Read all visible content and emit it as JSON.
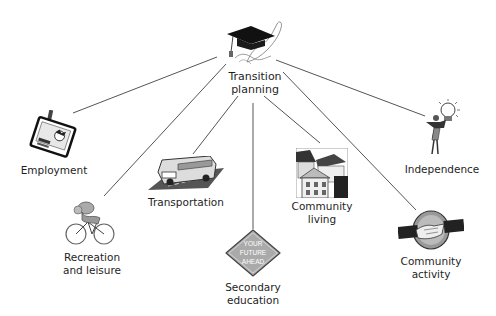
{
  "diagram": {
    "type": "hub-and-spoke",
    "center": {
      "id": "transition-planning",
      "label_line1": "Transition",
      "label_line2": "planning",
      "icon": "graduation-cap-diploma-icon"
    },
    "nodes": [
      {
        "id": "employment",
        "label_line1": "Employment",
        "label_line2": "",
        "icon": "id-badge-icon"
      },
      {
        "id": "recreation",
        "label_line1": "Recreation",
        "label_line2": "and leisure",
        "icon": "cyclist-icon"
      },
      {
        "id": "transportation",
        "label_line1": "Transportation",
        "label_line2": "",
        "icon": "bus-icon"
      },
      {
        "id": "secondary-education",
        "label_line1": "Secondary",
        "label_line2": "education",
        "icon": "road-sign-icon",
        "sign_text": [
          "YOUR",
          "FUTURE",
          "AHEAD"
        ]
      },
      {
        "id": "community-living",
        "label_line1": "Community",
        "label_line2": "living",
        "icon": "houses-icon"
      },
      {
        "id": "community-activity",
        "label_line1": "Community",
        "label_line2": "activity",
        "icon": "handshake-icon"
      },
      {
        "id": "independence",
        "label_line1": "Independence",
        "label_line2": "",
        "icon": "person-lightbulb-icon"
      }
    ],
    "edges": [
      {
        "from": "transition-planning",
        "to": "employment"
      },
      {
        "from": "transition-planning",
        "to": "recreation"
      },
      {
        "from": "transition-planning",
        "to": "transportation"
      },
      {
        "from": "transition-planning",
        "to": "secondary-education"
      },
      {
        "from": "transition-planning",
        "to": "community-living"
      },
      {
        "from": "transition-planning",
        "to": "community-activity"
      },
      {
        "from": "transition-planning",
        "to": "independence"
      }
    ],
    "colors": {
      "line": "#555555",
      "text": "#1e1e1e",
      "background": "#ffffff"
    }
  }
}
